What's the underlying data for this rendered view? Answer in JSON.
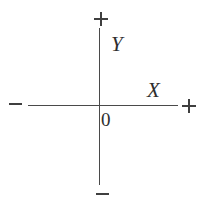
{
  "diagram": {
    "background_color": "#ffffff",
    "line_color": "#4a4a4a",
    "text_color": "#2e2e2e",
    "width": 209,
    "height": 203,
    "axes": [
      {
        "name": "y-axis",
        "orientation": "vertical",
        "label": "Y",
        "positive_end_sign": "+",
        "negative_end_sign": "−"
      },
      {
        "name": "x-axis",
        "orientation": "horizontal",
        "label": "X",
        "positive_end_sign": "+",
        "negative_end_sign": "−"
      }
    ],
    "origin_label": "0",
    "signs": {
      "top": "+",
      "bottom": "−",
      "left": "−",
      "right": "+"
    },
    "labels": {
      "y_axis_label": "Y",
      "x_axis_label": "X",
      "origin": "0"
    }
  }
}
